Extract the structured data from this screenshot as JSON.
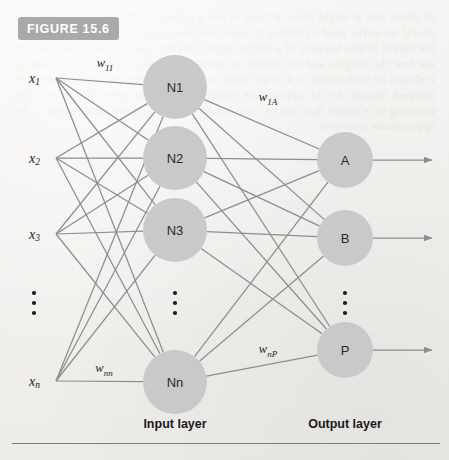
{
  "figure": {
    "badge_label": "FIGURE 15.6",
    "badge_color": "#a9a9a9",
    "badge_text_color": "#ffffff"
  },
  "colors": {
    "background": "#f3f2ef",
    "node_fill": "#c9c9c9",
    "edge": "#8d8d8d",
    "text": "#1d1d1d",
    "rule": "#7c7c7c"
  },
  "diagram": {
    "type": "neural-network",
    "inputs": [
      {
        "id": "x1",
        "base": "x",
        "sub": "1",
        "x": 40,
        "y": 78
      },
      {
        "id": "x2",
        "base": "x",
        "sub": "2",
        "x": 40,
        "y": 158
      },
      {
        "id": "x3",
        "base": "x",
        "sub": "3",
        "x": 40,
        "y": 234
      },
      {
        "id": "xn",
        "base": "x",
        "sub": "n",
        "x": 40,
        "y": 381
      }
    ],
    "input_ellipsis": {
      "x": 34,
      "y": 303
    },
    "input_layer": {
      "caption": "Input layer",
      "caption_x": 175,
      "caption_y": 424,
      "node_radius": 32,
      "nodes": [
        {
          "id": "N1",
          "label": "N1",
          "x": 175,
          "y": 87
        },
        {
          "id": "N2",
          "label": "N2",
          "x": 175,
          "y": 158
        },
        {
          "id": "N3",
          "label": "N3",
          "x": 175,
          "y": 230
        },
        {
          "id": "Nn",
          "label": "Nn",
          "x": 175,
          "y": 382
        }
      ],
      "ellipsis": {
        "x": 175,
        "y": 303
      }
    },
    "output_layer": {
      "caption": "Output layer",
      "caption_x": 345,
      "caption_y": 424,
      "node_radius": 28,
      "nodes": [
        {
          "id": "A",
          "label": "A",
          "x": 345,
          "y": 160
        },
        {
          "id": "B",
          "label": "B",
          "x": 345,
          "y": 238
        },
        {
          "id": "P",
          "label": "P",
          "x": 345,
          "y": 350
        }
      ],
      "ellipsis": {
        "x": 345,
        "y": 303
      },
      "arrow_end_x": 432
    },
    "weights": [
      {
        "id": "w11",
        "base": "w",
        "sub": "11",
        "x": 105,
        "y": 67
      },
      {
        "id": "wnn",
        "base": "w",
        "sub": "nn",
        "x": 104,
        "y": 372
      },
      {
        "id": "w1A",
        "base": "w",
        "sub": "1A",
        "x": 268,
        "y": 101
      },
      {
        "id": "wnP",
        "base": "w",
        "sub": "nP",
        "x": 268,
        "y": 353
      }
    ]
  },
  "bleed_text": "of them, and it might make it hard to see a pattern in the data. It is true that neural networks need examples to learn and manipulate them. Please, it is, but the output is true because of a single output, but for now it is not what you can see how the weights and the number of terms are defined. If exactly one output, it should be understood as a single input is a general case, and neurons are then mapped through to the appropriate output layer of the network nodes, with resulting in a model that can be used for prediction, and the final output is the approximate response."
}
